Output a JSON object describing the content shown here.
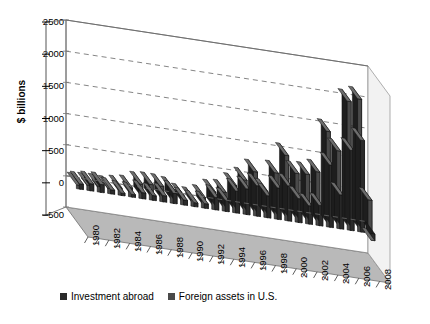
{
  "chart_data": {
    "type": "bar",
    "title": "",
    "subtitle": "",
    "xlabel": "",
    "ylabel": "$ billions",
    "ylim": [
      -500,
      2500
    ],
    "ytick_step": 500,
    "yticks": [
      2500,
      2000,
      1500,
      1000,
      500,
      0,
      -500
    ],
    "grid": true,
    "grid_style": "dashed",
    "projection": "3d-perspective",
    "legend_position": "bottom-left",
    "categories": [
      "1980",
      "1981",
      "1982",
      "1983",
      "1984",
      "1985",
      "1986",
      "1987",
      "1988",
      "1989",
      "1990",
      "1991",
      "1992",
      "1993",
      "1994",
      "1995",
      "1996",
      "1997",
      "1998",
      "1999",
      "2000",
      "2001",
      "2002",
      "2003",
      "2004",
      "2005",
      "2006",
      "2007",
      "2008"
    ],
    "tick_labels": [
      "1980",
      "1982",
      "1984",
      "1986",
      "1988",
      "1990",
      "1992",
      "1994",
      "1996",
      "1998",
      "2000",
      "2002",
      "2004",
      "2006",
      "2008"
    ],
    "series": [
      {
        "name": "Investment abroad",
        "color": "#2b2b2b",
        "values": [
          86,
          114,
          128,
          66,
          40,
          44,
          98,
          77,
          102,
          169,
          81,
          64,
          74,
          200,
          178,
          352,
          413,
          488,
          353,
          504,
          561,
          383,
          294,
          325,
          1000,
          546,
          1285,
          1472,
          -107
        ]
      },
      {
        "name": "Foreign assets in U.S.",
        "color": "#4a4a4a",
        "values": [
          62,
          86,
          96,
          88,
          118,
          146,
          230,
          249,
          247,
          224,
          141,
          111,
          171,
          282,
          306,
          438,
          551,
          707,
          423,
          741,
          1047,
          783,
          795,
          858,
          1533,
          1247,
          2065,
          2129,
          534
        ]
      }
    ],
    "notes": {
      "last_year_negative": true,
      "units": "$ billions"
    }
  },
  "legend": {
    "items": [
      {
        "label": "Investment abroad",
        "color": "#2b2b2b"
      },
      {
        "label": "Foreign assets in U.S.",
        "color": "#4a4a4a"
      }
    ]
  }
}
